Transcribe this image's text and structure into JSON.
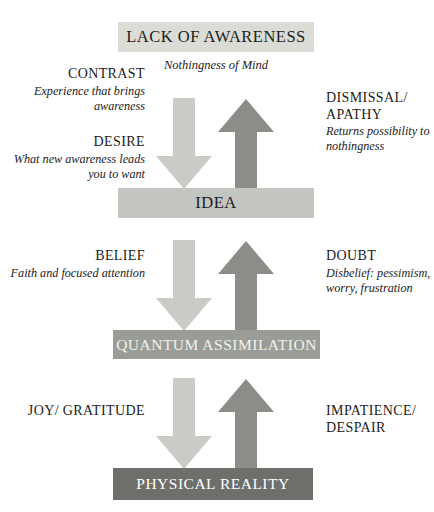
{
  "diagram": {
    "title": "LACK OF AWARENESS",
    "subtitle": "Nothingness of Mind",
    "stages": [
      {
        "id": "awareness",
        "label": "LACK OF AWARENESS",
        "fill": "#dcdcd7",
        "text_color": "#1c1c1c"
      },
      {
        "id": "idea",
        "label": "IDEA",
        "fill": "#c3c5c0",
        "text_color": "#1c1c1c"
      },
      {
        "id": "quantum",
        "label": "QUANTUM ASSIMILATION",
        "fill": "#9a9c97",
        "text_color": "#f2f2ee"
      },
      {
        "id": "physical",
        "label": "PHYSICAL REALITY",
        "fill": "#6e6f6b",
        "text_color": "#ffffff"
      }
    ],
    "arrow_colors": {
      "down": "#c9ccc6",
      "up": "#8b8d88"
    },
    "arrow_groups": [
      {
        "id": "tier-1",
        "down_icon": "arrow-down-icon",
        "up_icon": "arrow-up-icon"
      },
      {
        "id": "tier-2",
        "down_icon": "arrow-down-icon",
        "up_icon": "arrow-up-icon"
      },
      {
        "id": "tier-3",
        "down_icon": "arrow-down-icon",
        "up_icon": "arrow-up-icon"
      }
    ],
    "left_labels": [
      {
        "id": "contrast",
        "title": "CONTRAST",
        "desc": "Experience that brings awareness"
      },
      {
        "id": "desire",
        "title": "DESIRE",
        "desc": "What new awareness leads you to want"
      },
      {
        "id": "belief",
        "title": "BELIEF",
        "desc": "Faith and focused attention"
      },
      {
        "id": "joy",
        "title": "JOY/ GRATITUDE",
        "desc": ""
      }
    ],
    "right_labels": [
      {
        "id": "dismissal",
        "title": "DISMISSAL/ APATHY",
        "desc": "Returns possibility to nothingness"
      },
      {
        "id": "doubt",
        "title": "DOUBT",
        "desc": "Disbelief: pessimism, worry, frustration"
      },
      {
        "id": "impatience",
        "title": "IMPATIENCE/ DESPAIR",
        "desc": ""
      }
    ]
  }
}
